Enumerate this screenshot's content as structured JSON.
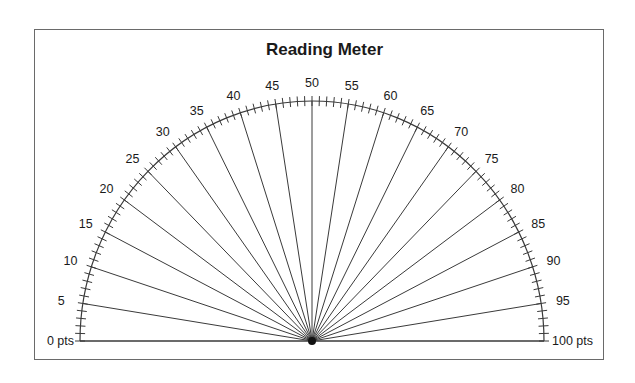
{
  "title": "Reading Meter",
  "meter": {
    "min": 0,
    "max": 100,
    "unit": "pts",
    "major_step": 5,
    "minor_step": 1,
    "labels": [
      "0 pts",
      "5",
      "10",
      "15",
      "20",
      "25",
      "30",
      "35",
      "40",
      "45",
      "50",
      "55",
      "60",
      "65",
      "70",
      "75",
      "80",
      "85",
      "90",
      "95",
      "100 pts"
    ],
    "colors": {
      "line": "#3a3a3a",
      "frame": "#6a6a6a",
      "text": "#1a1a1a"
    }
  }
}
